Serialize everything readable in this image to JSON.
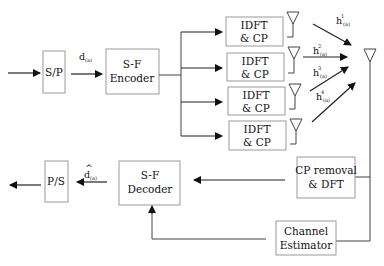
{
  "diagram": {
    "blocks": {
      "sp": "S/P",
      "encoder": [
        "S-F",
        "Encoder"
      ],
      "idft": [
        [
          "IDFT",
          "& CP"
        ],
        [
          "IDFT",
          "& CP"
        ],
        [
          "IDFT",
          "& CP"
        ],
        [
          "IDFT",
          "& CP"
        ]
      ],
      "cp_removal": [
        "CP removal",
        "& DFT"
      ],
      "decoder": [
        "S-F",
        "Decoder"
      ],
      "ps": "P/S",
      "estimator": [
        "Channel",
        "Estimator"
      ]
    },
    "labels": {
      "d_in": "d",
      "d_in_sub": "(a)",
      "d_hat": "d",
      "d_hat_accent": "^",
      "d_hat_sub": "(a)",
      "channels": [
        {
          "base": "h",
          "sup": "1",
          "sub": "(a)"
        },
        {
          "base": "h",
          "sup": "2",
          "sub": "(a)"
        },
        {
          "base": "h",
          "sup": "3",
          "sub": "(a)"
        },
        {
          "base": "h",
          "sup": "4",
          "sub": "(a)"
        }
      ]
    },
    "icons": [
      "transmit-antenna-icon",
      "receive-antenna-icon",
      "arrow-icon"
    ]
  }
}
